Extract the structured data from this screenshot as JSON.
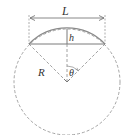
{
  "diagram": {
    "type": "circular-segment-geometry",
    "labels": {
      "chord_length": "L",
      "segment_height": "h",
      "radius": "R",
      "half_angle": "θ"
    },
    "colors": {
      "arc": "#8a8a8a",
      "lines": "#7a7a7a",
      "dashed": "#9a9a9a",
      "text": "#333333"
    }
  }
}
